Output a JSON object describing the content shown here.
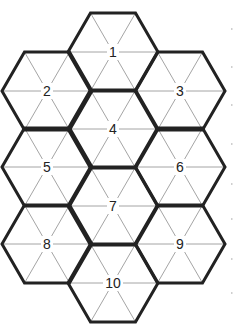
{
  "diagram": {
    "type": "hexagon-puzzle-grid",
    "hex_radius": 45,
    "colors": {
      "outline": "#222222",
      "grid": "#9a9a9a",
      "label": "#222222",
      "background": "#ffffff"
    },
    "hexagons": [
      {
        "label": "1",
        "cx": 113,
        "cy": 52
      },
      {
        "label": "2",
        "cx": 47,
        "cy": 91
      },
      {
        "label": "3",
        "cx": 180,
        "cy": 91
      },
      {
        "label": "4",
        "cx": 113,
        "cy": 129
      },
      {
        "label": "5",
        "cx": 47,
        "cy": 167
      },
      {
        "label": "6",
        "cx": 180,
        "cy": 167
      },
      {
        "label": "7",
        "cx": 113,
        "cy": 206
      },
      {
        "label": "8",
        "cx": 47,
        "cy": 244
      },
      {
        "label": "9",
        "cx": 180,
        "cy": 244
      },
      {
        "label": "10",
        "cx": 113,
        "cy": 283
      }
    ]
  }
}
